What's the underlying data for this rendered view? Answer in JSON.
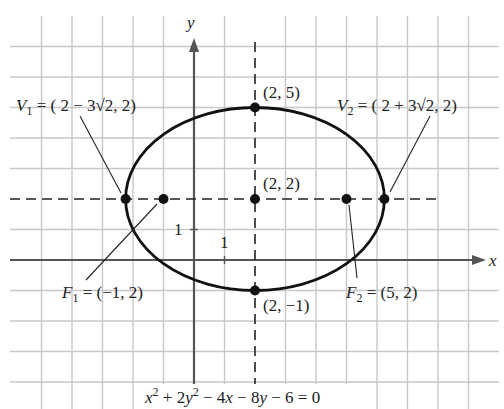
{
  "figure": {
    "axes": {
      "x_label": "x",
      "y_label": "y",
      "x_tick_label": "1",
      "y_tick_label": "1",
      "origin_px": [
        194,
        260
      ],
      "unit_px": 30.5
    },
    "ellipse": {
      "center": [
        2,
        2
      ],
      "semi_major": 4.2426,
      "semi_minor": 3,
      "equation": "x² + 2y² − 4x − 8y − 6 = 0"
    },
    "points": [
      {
        "id": "V1",
        "label_main": "V",
        "label_sub": "1",
        "label_rest": " = ( 2 − 3√2, 2)",
        "coords": [
          -2.2426,
          2
        ]
      },
      {
        "id": "F1",
        "label_main": "F",
        "label_sub": "1",
        "label_rest": " = (−1, 2)",
        "coords": [
          -1,
          2
        ]
      },
      {
        "id": "center",
        "label_rest": "(2, 2)",
        "coords": [
          2,
          2
        ]
      },
      {
        "id": "F2",
        "label_main": "F",
        "label_sub": "2",
        "label_rest": " = (5, 2)",
        "coords": [
          5,
          2
        ]
      },
      {
        "id": "V2",
        "label_main": "V",
        "label_sub": "2",
        "label_rest": " = ( 2 + 3√2, 2)",
        "coords": [
          6.2426,
          2
        ]
      },
      {
        "id": "top",
        "label_rest": "(2, 5)",
        "coords": [
          2,
          5
        ]
      },
      {
        "id": "bottom",
        "label_rest": "(2, −1)",
        "coords": [
          2,
          -1
        ]
      }
    ],
    "equation_parts": {
      "a": "x",
      "a_sup": "2",
      "b": " + 2",
      "c": "y",
      "c_sup": "2",
      "d": " − 4",
      "e": "x",
      "f": " − 8",
      "g": "y",
      "h": " − 6 = 0"
    },
    "colors": {
      "grid": "#c8c8c8",
      "axis": "#555555",
      "curve": "#111111",
      "text": "#222222"
    }
  }
}
